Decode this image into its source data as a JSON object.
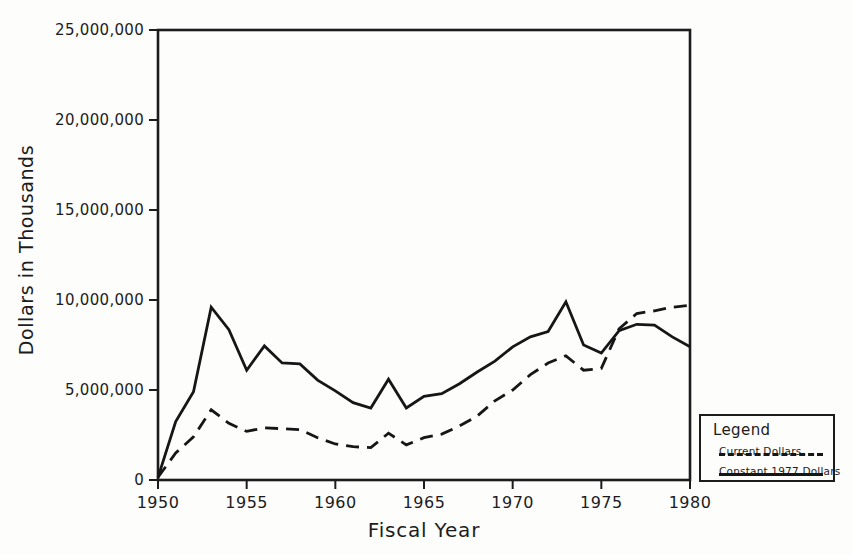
{
  "colors": {
    "background": "#fdfdfc",
    "ink": "#1c1c1c",
    "line": "#161616"
  },
  "chart_data": {
    "type": "line",
    "title": "",
    "xlabel": "Fiscal Year",
    "ylabel": "Dollars in Thousands",
    "x_range": [
      1950,
      1980
    ],
    "y_range": [
      0,
      25000000
    ],
    "grid": false,
    "legend_position": "outside-bottom-right",
    "x_ticks": [
      {
        "label": "1950",
        "value": 1950
      },
      {
        "label": "1955",
        "value": 1955
      },
      {
        "label": "1960",
        "value": 1960
      },
      {
        "label": "1965",
        "value": 1965
      },
      {
        "label": "1970",
        "value": 1970
      },
      {
        "label": "1975",
        "value": 1975
      },
      {
        "label": "1980",
        "value": 1980
      }
    ],
    "y_ticks": [
      {
        "label": "0",
        "value": 0
      },
      {
        "label": "5,000,000",
        "value": 5000000
      },
      {
        "label": "10,000,000",
        "value": 10000000
      },
      {
        "label": "15,000,000",
        "value": 15000000
      },
      {
        "label": "20,000,000",
        "value": 20000000
      },
      {
        "label": "25,000,000",
        "value": 25000000
      }
    ],
    "years": [
      1950,
      1951,
      1952,
      1953,
      1954,
      1955,
      1956,
      1957,
      1958,
      1959,
      1960,
      1961,
      1962,
      1963,
      1964,
      1965,
      1966,
      1967,
      1968,
      1969,
      1970,
      1971,
      1972,
      1973,
      1974,
      1975,
      1976,
      1977,
      1978,
      1979,
      1980
    ],
    "series": [
      {
        "name": "Current Dollars",
        "style": "dashed",
        "values": [
          150000,
          1500000,
          2400000,
          3900000,
          3150000,
          2700000,
          2900000,
          2850000,
          2800000,
          2350000,
          2000000,
          1850000,
          1800000,
          2600000,
          1950000,
          2350000,
          2550000,
          3000000,
          3550000,
          4400000,
          5000000,
          5850000,
          6500000,
          6900000,
          6100000,
          6200000,
          8400000,
          9250000,
          9400000,
          9600000,
          9700000
        ]
      },
      {
        "name": "Constant 1977 Dollars",
        "style": "solid",
        "values": [
          150000,
          3250000,
          4900000,
          9600000,
          8350000,
          6100000,
          7450000,
          6500000,
          6450000,
          5550000,
          4950000,
          4300000,
          4000000,
          5600000,
          4000000,
          4650000,
          4800000,
          5350000,
          6000000,
          6600000,
          7400000,
          7950000,
          8250000,
          9900000,
          7500000,
          7050000,
          8300000,
          8650000,
          8600000,
          7950000,
          7400000
        ]
      }
    ]
  },
  "legend": {
    "title": "Legend"
  }
}
